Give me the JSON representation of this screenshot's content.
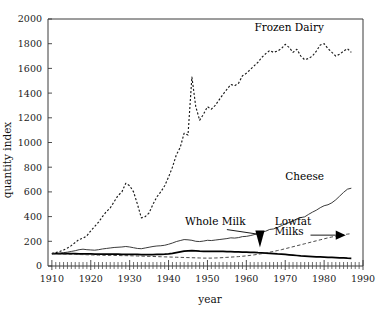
{
  "chart_data": {
    "type": "line",
    "title": "",
    "xlabel": "year",
    "ylabel": "quantity index",
    "xlim": [
      1909,
      1990
    ],
    "ylim": [
      0,
      2000
    ],
    "grid": false,
    "legend_position": "inline-annotations",
    "x_ticks_major": [
      1910,
      1920,
      1930,
      1940,
      1950,
      1960,
      1970,
      1980,
      1990
    ],
    "x_tick_labels": [
      "1910",
      "1920",
      "1930",
      "1940",
      "1950",
      "1960",
      "1970",
      "1980",
      "1990"
    ],
    "x_minor_tick_step": 1,
    "y_ticks": [
      0,
      200,
      400,
      600,
      800,
      1000,
      1200,
      1400,
      1600,
      1800,
      2000
    ],
    "y_tick_labels": [
      "0",
      "200",
      "400",
      "600",
      "800",
      "1000",
      "1200",
      "1400",
      "1600",
      "1800",
      "2000"
    ],
    "annotations": [
      {
        "text": "Frozen Dairy",
        "series": "Frozen Dairy",
        "x": 1971,
        "y": 1905,
        "arrow": false
      },
      {
        "text": "Cheese",
        "series": "Cheese",
        "x": 1975,
        "y": 700,
        "arrow": false
      },
      {
        "text": "Whole Milk",
        "series": "Whole Milk",
        "x": 1952,
        "y": 330,
        "arrow": true
      },
      {
        "text": "Lowfat",
        "series": "Lowfat Milks",
        "x": 1972,
        "y": 330,
        "arrow": false
      },
      {
        "text": "Milks",
        "series": "Lowfat Milks",
        "x": 1971,
        "y": 255,
        "arrow": true
      }
    ],
    "series": [
      {
        "name": "Frozen Dairy",
        "style": "dotted",
        "color": "#1a1a1a",
        "x": [
          1910,
          1911,
          1912,
          1913,
          1914,
          1915,
          1916,
          1917,
          1918,
          1919,
          1920,
          1921,
          1922,
          1923,
          1924,
          1925,
          1926,
          1927,
          1928,
          1929,
          1930,
          1931,
          1932,
          1933,
          1934,
          1935,
          1936,
          1937,
          1938,
          1939,
          1940,
          1941,
          1942,
          1943,
          1944,
          1945,
          1946,
          1947,
          1948,
          1949,
          1950,
          1951,
          1952,
          1953,
          1954,
          1955,
          1956,
          1957,
          1958,
          1959,
          1960,
          1961,
          1962,
          1963,
          1964,
          1965,
          1966,
          1967,
          1968,
          1969,
          1970,
          1971,
          1972,
          1973,
          1974,
          1975,
          1976,
          1977,
          1978,
          1979,
          1980,
          1981,
          1982,
          1983,
          1984,
          1985,
          1986,
          1987
        ],
        "values": [
          100,
          108,
          118,
          130,
          145,
          165,
          190,
          215,
          225,
          245,
          285,
          320,
          355,
          400,
          440,
          470,
          520,
          570,
          600,
          670,
          650,
          600,
          500,
          390,
          400,
          430,
          500,
          560,
          600,
          650,
          720,
          800,
          900,
          960,
          1075,
          1060,
          1530,
          1290,
          1180,
          1230,
          1290,
          1270,
          1300,
          1345,
          1390,
          1430,
          1470,
          1460,
          1480,
          1540,
          1560,
          1590,
          1620,
          1650,
          1690,
          1720,
          1745,
          1730,
          1740,
          1760,
          1795,
          1770,
          1730,
          1755,
          1700,
          1670,
          1680,
          1700,
          1740,
          1790,
          1800,
          1760,
          1730,
          1700,
          1715,
          1740,
          1760,
          1730
        ]
      },
      {
        "name": "Cheese",
        "style": "solid-thin",
        "color": "#303030",
        "x": [
          1910,
          1911,
          1912,
          1913,
          1914,
          1915,
          1916,
          1917,
          1918,
          1919,
          1920,
          1921,
          1922,
          1923,
          1924,
          1925,
          1926,
          1927,
          1928,
          1929,
          1930,
          1931,
          1932,
          1933,
          1934,
          1935,
          1936,
          1937,
          1938,
          1939,
          1940,
          1941,
          1942,
          1943,
          1944,
          1945,
          1946,
          1947,
          1948,
          1949,
          1950,
          1951,
          1952,
          1953,
          1954,
          1955,
          1956,
          1957,
          1958,
          1959,
          1960,
          1961,
          1962,
          1963,
          1964,
          1965,
          1966,
          1967,
          1968,
          1969,
          1970,
          1971,
          1972,
          1973,
          1974,
          1975,
          1976,
          1977,
          1978,
          1979,
          1980,
          1981,
          1982,
          1983,
          1984,
          1985,
          1986,
          1987
        ],
        "values": [
          100,
          102,
          104,
          108,
          112,
          118,
          124,
          132,
          136,
          132,
          130,
          128,
          132,
          138,
          142,
          146,
          150,
          152,
          154,
          158,
          154,
          148,
          142,
          140,
          146,
          152,
          158,
          162,
          164,
          168,
          176,
          186,
          198,
          206,
          214,
          212,
          208,
          200,
          198,
          202,
          208,
          206,
          210,
          214,
          218,
          222,
          228,
          226,
          230,
          238,
          240,
          246,
          254,
          262,
          272,
          282,
          296,
          300,
          312,
          326,
          342,
          352,
          364,
          382,
          392,
          398,
          418,
          436,
          452,
          472,
          488,
          496,
          512,
          536,
          566,
          596,
          622,
          630
        ]
      },
      {
        "name": "Whole Milk",
        "style": "solid-thick",
        "color": "#000000",
        "x": [
          1910,
          1911,
          1912,
          1913,
          1914,
          1915,
          1916,
          1917,
          1918,
          1919,
          1920,
          1921,
          1922,
          1923,
          1924,
          1925,
          1926,
          1927,
          1928,
          1929,
          1930,
          1931,
          1932,
          1933,
          1934,
          1935,
          1936,
          1937,
          1938,
          1939,
          1940,
          1941,
          1942,
          1943,
          1944,
          1945,
          1946,
          1947,
          1948,
          1949,
          1950,
          1951,
          1952,
          1953,
          1954,
          1955,
          1956,
          1957,
          1958,
          1959,
          1960,
          1961,
          1962,
          1963,
          1964,
          1965,
          1966,
          1967,
          1968,
          1969,
          1970,
          1971,
          1972,
          1973,
          1974,
          1975,
          1976,
          1977,
          1978,
          1979,
          1980,
          1981,
          1982,
          1983,
          1984,
          1985,
          1986,
          1987
        ],
        "values": [
          100,
          100,
          100,
          100,
          100,
          100,
          100,
          99,
          99,
          98,
          98,
          97,
          97,
          97,
          96,
          96,
          96,
          96,
          95,
          95,
          95,
          94,
          94,
          93,
          93,
          93,
          93,
          94,
          95,
          96,
          98,
          102,
          108,
          114,
          120,
          122,
          124,
          122,
          120,
          119,
          119,
          118,
          118,
          118,
          118,
          117,
          116,
          115,
          114,
          113,
          112,
          111,
          110,
          108,
          107,
          105,
          103,
          101,
          98,
          96,
          94,
          91,
          88,
          85,
          82,
          80,
          78,
          76,
          74,
          73,
          72,
          70,
          69,
          68,
          66,
          65,
          63,
          62
        ]
      },
      {
        "name": "Lowfat Milks",
        "style": "dashed",
        "color": "#2b2b2b",
        "x": [
          1910,
          1911,
          1912,
          1913,
          1914,
          1915,
          1916,
          1917,
          1918,
          1919,
          1920,
          1921,
          1922,
          1923,
          1924,
          1925,
          1926,
          1927,
          1928,
          1929,
          1930,
          1931,
          1932,
          1933,
          1934,
          1935,
          1936,
          1937,
          1938,
          1939,
          1940,
          1941,
          1942,
          1943,
          1944,
          1945,
          1946,
          1947,
          1948,
          1949,
          1950,
          1951,
          1952,
          1953,
          1954,
          1955,
          1956,
          1957,
          1958,
          1959,
          1960,
          1961,
          1962,
          1963,
          1964,
          1965,
          1966,
          1967,
          1968,
          1969,
          1970,
          1971,
          1972,
          1973,
          1974,
          1975,
          1976,
          1977,
          1978,
          1979,
          1980,
          1981,
          1982,
          1983,
          1984,
          1985,
          1986,
          1987
        ],
        "values": [
          100,
          99,
          98,
          97,
          96,
          95,
          94,
          93,
          92,
          91,
          90,
          89,
          88,
          87,
          86,
          86,
          85,
          85,
          84,
          84,
          83,
          82,
          81,
          80,
          79,
          78,
          77,
          76,
          75,
          74,
          73,
          72,
          71,
          70,
          69,
          68,
          67,
          66,
          65,
          64,
          64,
          64,
          65,
          66,
          68,
          70,
          72,
          74,
          76,
          79,
          82,
          86,
          90,
          95,
          100,
          106,
          112,
          118,
          125,
          132,
          140,
          148,
          156,
          164,
          172,
          180,
          188,
          196,
          204,
          212,
          220,
          228,
          235,
          242,
          248,
          254,
          258,
          262
        ]
      }
    ]
  }
}
